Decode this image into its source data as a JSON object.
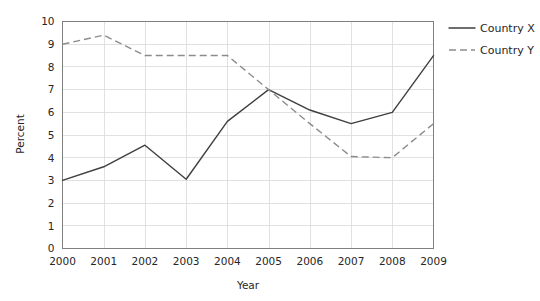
{
  "chart_data": {
    "type": "line",
    "title": "",
    "xlabel": "Year",
    "ylabel": "Percent",
    "categories": [
      "2000",
      "2001",
      "2002",
      "2003",
      "2004",
      "2005",
      "2006",
      "2007",
      "2008",
      "2009"
    ],
    "x": [
      2000,
      2001,
      2002,
      2003,
      2004,
      2005,
      2006,
      2007,
      2008,
      2009
    ],
    "xlim": [
      2000,
      2009
    ],
    "ylim": [
      0,
      10
    ],
    "ytick_labels": [
      "0",
      "1",
      "2",
      "3",
      "4",
      "5",
      "6",
      "7",
      "8",
      "9",
      "10"
    ],
    "yticks": [
      0,
      1,
      2,
      3,
      4,
      5,
      6,
      7,
      8,
      9,
      10
    ],
    "grid": true,
    "legend_position": "right",
    "series": [
      {
        "name": "Country X",
        "style": "solid",
        "color": "#3f3f3f",
        "values": [
          3.0,
          3.6,
          4.55,
          3.05,
          5.6,
          7.0,
          6.1,
          5.5,
          6.0,
          8.5
        ]
      },
      {
        "name": "Country Y",
        "style": "dashed",
        "color": "#8c8c8c",
        "values": [
          9.0,
          9.4,
          8.5,
          8.5,
          8.5,
          7.0,
          5.5,
          4.05,
          4.0,
          5.5
        ]
      }
    ]
  },
  "legend": {
    "items": [
      {
        "label": "Country X",
        "style": "solid"
      },
      {
        "label": "Country Y",
        "style": "dashed"
      }
    ]
  },
  "axes": {
    "x_title": "Year",
    "y_title": "Percent"
  }
}
